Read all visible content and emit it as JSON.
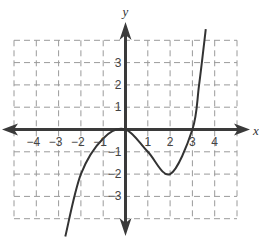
{
  "chart_data": {
    "type": "line",
    "title": "",
    "xlabel": "x",
    "ylabel": "y",
    "xlim": [
      -5,
      5
    ],
    "ylim": [
      -4,
      4
    ],
    "grid": true,
    "grid_style": "dashed",
    "x_tick_labels": [
      "-4",
      "-3",
      "-2",
      "-1",
      "1",
      "2",
      "3",
      "4"
    ],
    "x_ticks": [
      -4,
      -3,
      -2,
      -1,
      1,
      2,
      3,
      4
    ],
    "y_tick_labels": [
      "3",
      "2",
      "1",
      "-1",
      "-2",
      "-3"
    ],
    "y_ticks": [
      3,
      2,
      1,
      -1,
      -2,
      -3
    ],
    "series": [
      {
        "name": "curve",
        "description": "cubic-shaped function with local max at (0,0), local min at (2,-2), x-intercepts at 0 and 3",
        "points": [
          [
            -2.7,
            -4.8
          ],
          [
            -2,
            -2
          ],
          [
            -1,
            -0.4
          ],
          [
            0,
            0
          ],
          [
            1,
            -1
          ],
          [
            2,
            -2
          ],
          [
            3,
            0
          ],
          [
            3.3,
            2
          ],
          [
            3.6,
            4.5
          ]
        ]
      }
    ],
    "annotations": []
  },
  "colors": {
    "axis": "#3a3a3a",
    "grid": "#9a9a9a",
    "curve": "#333333",
    "text": "#444444"
  }
}
